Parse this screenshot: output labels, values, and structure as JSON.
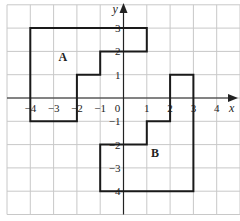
{
  "diagram": {
    "type": "coordinate-grid",
    "x_axis": {
      "label": "x",
      "ticks": [
        "-4",
        "-3",
        "-2",
        "-1",
        "0",
        "1",
        "2",
        "3",
        "4"
      ]
    },
    "y_axis": {
      "label": "y",
      "ticks": [
        "3",
        "2",
        "1",
        "-1",
        "-2",
        "-3",
        "-4"
      ]
    },
    "grid": {
      "x_range": [
        -5,
        5
      ],
      "y_range": [
        -5,
        4
      ]
    },
    "shapes": [
      {
        "label": "A",
        "vertices": [
          [
            -4,
            3
          ],
          [
            1,
            3
          ],
          [
            1,
            2
          ],
          [
            -1,
            2
          ],
          [
            -1,
            1
          ],
          [
            -2,
            1
          ],
          [
            -2,
            -1
          ],
          [
            -4,
            -1
          ]
        ]
      },
      {
        "label": "B",
        "vertices": [
          [
            2,
            1
          ],
          [
            3,
            1
          ],
          [
            3,
            -4
          ],
          [
            -1,
            -4
          ],
          [
            -1,
            -2
          ],
          [
            1,
            -2
          ],
          [
            1,
            -1
          ],
          [
            2,
            -1
          ]
        ]
      }
    ],
    "colors": {
      "grid": "#c8c8c8",
      "axis": "#222222",
      "shape": "#1a1a1a"
    }
  }
}
